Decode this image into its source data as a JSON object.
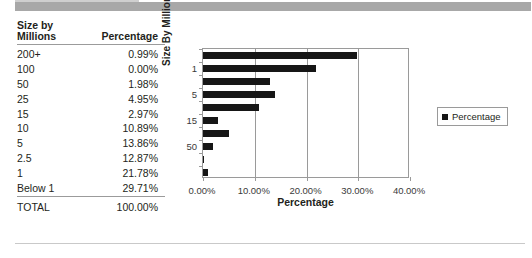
{
  "table": {
    "header": {
      "col1_line1": "Size by",
      "col1_line2": "Millions",
      "col2": "Percentage"
    },
    "rows": [
      {
        "label": "200+",
        "value": "0.99%"
      },
      {
        "label": "100",
        "value": "0.00%"
      },
      {
        "label": "50",
        "value": "1.98%"
      },
      {
        "label": "25",
        "value": "4.95%"
      },
      {
        "label": "15",
        "value": "2.97%"
      },
      {
        "label": "10",
        "value": "10.89%"
      },
      {
        "label": "5",
        "value": "13.86%"
      },
      {
        "label": "2.5",
        "value": "12.87%"
      },
      {
        "label": "1",
        "value": "21.78%"
      },
      {
        "label": "Below 1",
        "value": "29.71%"
      }
    ],
    "total": {
      "label": "TOTAL",
      "value": "100.00%"
    }
  },
  "legend": {
    "entries": [
      {
        "label": "Percentage",
        "color": "#161616",
        "swatch_icon": "square-swatch-icon"
      }
    ]
  },
  "chart_data": {
    "type": "bar",
    "orientation": "horizontal",
    "title": "",
    "xlabel": "Percentage",
    "ylabel": "Size By Millions",
    "xlim": [
      0,
      40
    ],
    "xticks": [
      0,
      10,
      20,
      30,
      40
    ],
    "xtick_labels": [
      "0.00%",
      "10.00%",
      "20.00%",
      "30.00%",
      "40.00%"
    ],
    "grid": "vertical",
    "legend_position": "right",
    "series": [
      {
        "name": "Percentage",
        "color": "#161616",
        "categories": [
          "Below 1",
          "1",
          "2.5",
          "5",
          "10",
          "15",
          "25",
          "50",
          "100",
          "200+"
        ],
        "values": [
          29.71,
          21.78,
          12.87,
          13.86,
          10.89,
          2.97,
          4.95,
          1.98,
          0.0,
          0.99
        ]
      }
    ],
    "ytick_labels_shown": [
      "1",
      "5",
      "15",
      "50",
      "200"
    ]
  }
}
